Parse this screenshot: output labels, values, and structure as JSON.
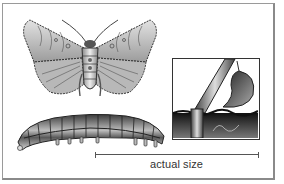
{
  "figure": {
    "scale_label": "actual size",
    "panels": [
      {
        "name": "moth",
        "description": "adult moth, wings spread"
      },
      {
        "name": "caterpillar",
        "description": "larva (cutworm)"
      },
      {
        "name": "inset",
        "description": "plant stem cut at soil level"
      }
    ],
    "colors": {
      "frame": "#9a9a9a",
      "ink": "#333333",
      "wing_fill": "#c8c8c8",
      "soil": "#1e1e1e"
    }
  }
}
